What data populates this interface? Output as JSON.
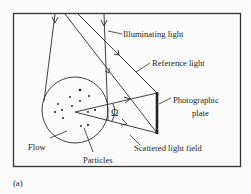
{
  "figure": {
    "panel_label": "(a)",
    "labels": {
      "illuminating_light": "Illuminating light",
      "reference_light": "Reference light",
      "photographic_plate_line1": "Photographic",
      "photographic_plate_line2": "plate",
      "omega": "Ω",
      "flow": "Flow",
      "particles": "Particles",
      "scattered_light_field": "Scattered light field"
    },
    "colors": {
      "line": "#2a2a2a",
      "frame": "#333333",
      "background": "#fcfcfc"
    }
  }
}
